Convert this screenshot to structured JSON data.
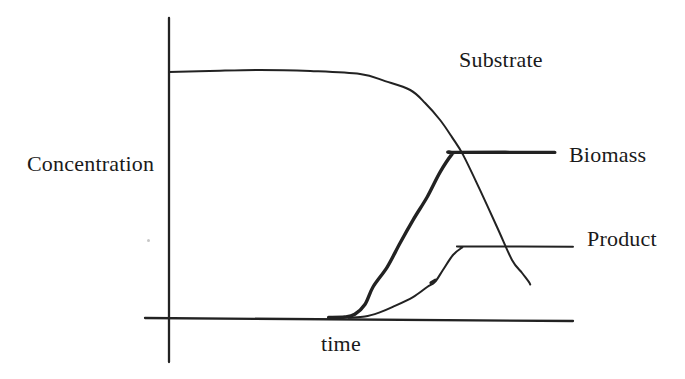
{
  "colors": {
    "ink": "#222222",
    "text": "#1a1a1a",
    "paper": "#ffffff"
  },
  "chart_data": {
    "type": "line",
    "title": "",
    "xlabel": "time",
    "ylabel": "Concentration",
    "xlim": [
      0,
      10
    ],
    "ylim": [
      0,
      1.05
    ],
    "grid": false,
    "axis_ticks": "none",
    "legend": "direct-annotation",
    "series": [
      {
        "name": "Substrate",
        "line_weight": "thin",
        "x": [
          0,
          1.0,
          2.25,
          3.5,
          4.73,
          5.35,
          5.97,
          6.34,
          6.71,
          7.0,
          7.28,
          7.7,
          8.12,
          8.49,
          8.74,
          8.91,
          8.94
        ],
        "y": [
          1.0,
          1.004,
          1.008,
          1.004,
          0.992,
          0.963,
          0.927,
          0.874,
          0.805,
          0.736,
          0.663,
          0.52,
          0.37,
          0.236,
          0.183,
          0.146,
          0.136
        ]
      },
      {
        "name": "Biomass",
        "line_weight": "thick",
        "x": [
          3.95,
          4.35,
          4.6,
          4.85,
          5.05,
          5.4,
          5.72,
          6.04,
          6.39,
          6.71,
          7.01,
          7.1,
          9.55
        ],
        "y": [
          0.002,
          0.004,
          0.015,
          0.055,
          0.126,
          0.207,
          0.305,
          0.398,
          0.492,
          0.593,
          0.667,
          0.673,
          0.673
        ]
      },
      {
        "name": "Product",
        "line_weight": "thin",
        "x": [
          4.45,
          4.85,
          5.2,
          5.54,
          6.04,
          6.39,
          6.58,
          6.78,
          7.03,
          7.26,
          7.34,
          10.0
        ],
        "y": [
          0.001,
          0.006,
          0.022,
          0.045,
          0.085,
          0.126,
          0.146,
          0.195,
          0.256,
          0.287,
          0.291,
          0.29
        ]
      }
    ]
  }
}
